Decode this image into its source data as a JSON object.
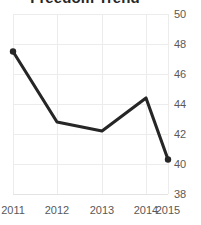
{
  "chart_data": {
    "type": "line",
    "title": "Freedom Trend",
    "xlabel": "",
    "ylabel": "",
    "categories": [
      "2011",
      "2012",
      "2013",
      "2014",
      "2015"
    ],
    "values": [
      47.5,
      42.8,
      42.2,
      44.4,
      40.3
    ],
    "series": [
      {
        "name": "Freedom Trend",
        "values": [
          47.5,
          42.8,
          42.2,
          44.4,
          40.3
        ]
      }
    ],
    "x": [
      2011,
      2012,
      2013,
      2014,
      2015
    ],
    "ylim": [
      38,
      50
    ],
    "yticks": [
      50,
      48,
      46,
      44,
      42,
      40,
      38
    ],
    "xticks": [
      "2011",
      "2012",
      "2013",
      "2014",
      "2015"
    ],
    "grid": true,
    "legend": false,
    "legend_position": "none",
    "colors": {
      "line": "#262626",
      "marker": "#262626",
      "grid": "#ececec",
      "tick_label": "#595959",
      "title": "#262626",
      "background": "#ffffff"
    }
  }
}
